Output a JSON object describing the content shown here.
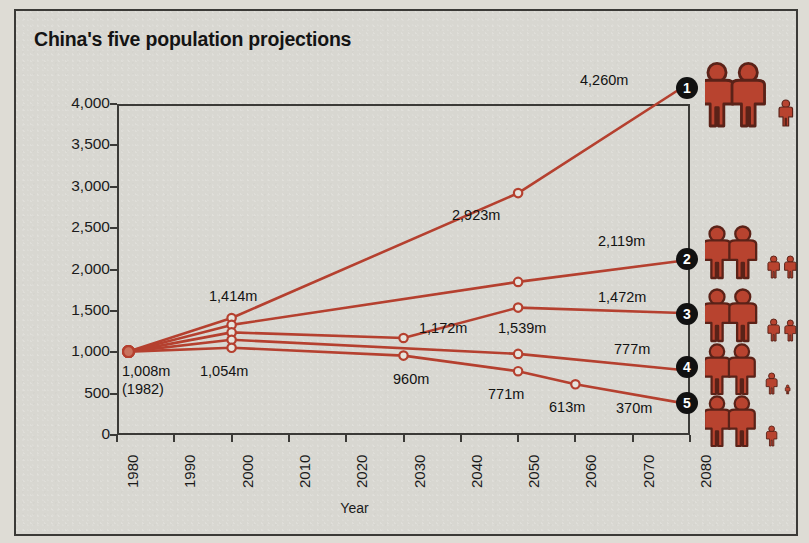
{
  "title": "China's five population projections",
  "axes": {
    "ylabel": "Population in millions",
    "xlabel": "Year",
    "yticks": [
      "4,000",
      "3,500",
      "3,000",
      "2,500",
      "2,000",
      "1,500",
      "1,000",
      "500",
      "0"
    ],
    "xticks": [
      "1980",
      "1990",
      "2000",
      "2010",
      "2020",
      "2030",
      "2040",
      "2050",
      "2060",
      "2070",
      "2080"
    ]
  },
  "annotations": {
    "start_value": "1,008m",
    "start_year": "(1982)",
    "y2000_top": "1,414m",
    "y2000_bottom": "1,054m",
    "y2030_s3": "1,172m",
    "y2030_s5": "960m",
    "y2050_s1": "2,923m",
    "y2050_s3": "1,539m",
    "y2050_s5": "771m",
    "y2060_s5": "613m",
    "end_s1": "4,260m",
    "end_s2": "2,119m",
    "end_s3": "1,472m",
    "end_s4": "777m",
    "end_s5": "370m"
  },
  "badges": [
    "1",
    "2",
    "3",
    "4",
    "5"
  ],
  "colors": {
    "line": "#b5402f",
    "figure": "#b8432f",
    "figure_outline": "#5a2218",
    "background": "#d8d7d1",
    "frame": "#3b3a37",
    "badge": "#111111",
    "text": "#131313"
  },
  "chart_data": {
    "type": "line",
    "title": "China's five population projections",
    "xlabel": "Year",
    "ylabel": "Population in millions",
    "xlim": [
      1980,
      2080
    ],
    "ylim": [
      0,
      4000
    ],
    "grid": false,
    "legend": "none",
    "series": [
      {
        "name": "1",
        "label": "Projection 1",
        "family": "2 adults, 3 children",
        "points": [
          {
            "x": 1982,
            "y": 1008,
            "label": "1,008m"
          },
          {
            "x": 2000,
            "y": 1414,
            "label": "1,414m"
          },
          {
            "x": 2050,
            "y": 2923,
            "label": "2,923m"
          },
          {
            "x": 2080,
            "y": 4260,
            "label": "4,260m"
          }
        ]
      },
      {
        "name": "2",
        "label": "Projection 2",
        "family": "2 adults, 2 children plus",
        "points": [
          {
            "x": 1982,
            "y": 1008,
            "label": "1,008m"
          },
          {
            "x": 2000,
            "y": 1330,
            "label": ""
          },
          {
            "x": 2050,
            "y": 1850,
            "label": ""
          },
          {
            "x": 2080,
            "y": 2119,
            "label": "2,119m"
          }
        ]
      },
      {
        "name": "3",
        "label": "Projection 3",
        "family": "2 adults, 2 children",
        "points": [
          {
            "x": 1982,
            "y": 1008,
            "label": "1,008m"
          },
          {
            "x": 2000,
            "y": 1240,
            "label": ""
          },
          {
            "x": 2030,
            "y": 1172,
            "label": "1,172m"
          },
          {
            "x": 2050,
            "y": 1539,
            "label": "1,539m"
          },
          {
            "x": 2080,
            "y": 1472,
            "label": "1,472m"
          }
        ]
      },
      {
        "name": "4",
        "label": "Projection 4",
        "family": "2 adults, 1 child plus",
        "points": [
          {
            "x": 1982,
            "y": 1008,
            "label": "1,008m"
          },
          {
            "x": 2000,
            "y": 1150,
            "label": ""
          },
          {
            "x": 2050,
            "y": 980,
            "label": ""
          },
          {
            "x": 2080,
            "y": 777,
            "label": "777m"
          }
        ]
      },
      {
        "name": "5",
        "label": "Projection 5",
        "family": "2 adults, 1 child",
        "points": [
          {
            "x": 1982,
            "y": 1008,
            "label": "1,008m"
          },
          {
            "x": 2000,
            "y": 1054,
            "label": "1,054m"
          },
          {
            "x": 2030,
            "y": 960,
            "label": "960m"
          },
          {
            "x": 2050,
            "y": 771,
            "label": "771m"
          },
          {
            "x": 2060,
            "y": 613,
            "label": "613m"
          },
          {
            "x": 2080,
            "y": 370,
            "label": "370m"
          }
        ]
      }
    ]
  }
}
